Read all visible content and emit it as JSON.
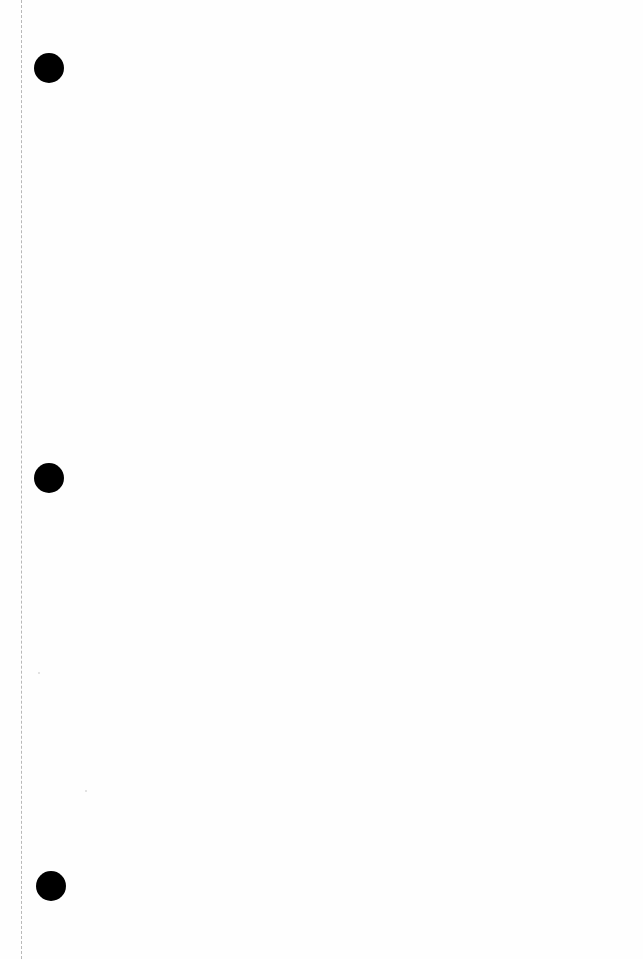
{
  "page": {
    "type": "blank-punched-sheet",
    "background_color": "#fefefe",
    "hole_color": "#000000",
    "margin_line_color": "#b8b8b8",
    "punch_holes": [
      {
        "cx": 49,
        "cy": 68,
        "diameter": 30
      },
      {
        "cx": 49,
        "cy": 478,
        "diameter": 30
      },
      {
        "cx": 51,
        "cy": 886,
        "diameter": 30
      }
    ],
    "text": ""
  }
}
